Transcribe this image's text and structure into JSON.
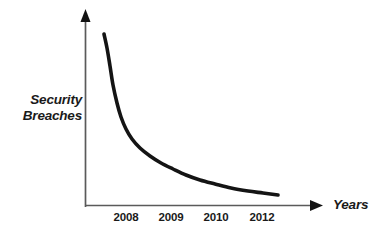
{
  "figure": {
    "background_color": "#ffffff",
    "curve_color": "#141414",
    "axis_color": "#5a5a5a",
    "text_color": "#1a1a1a"
  },
  "axes": {
    "y_title_line1": "Security",
    "y_title_line2": "Breaches",
    "x_title": "Years",
    "y_arrow": "arrow-up-icon",
    "x_arrow": "arrow-right-icon"
  },
  "caption": {
    "clipped_text": ""
  },
  "chart_data": {
    "type": "line",
    "title": "",
    "subtitle": "",
    "xlabel": "Years",
    "ylabel": "Security Breaches",
    "grid": false,
    "legend": null,
    "legend_position": "none",
    "annotations": [],
    "x_tick_labels": [
      "2008",
      "2009",
      "2010",
      "2012"
    ],
    "x_tick_positions": [
      126,
      171,
      216,
      262
    ],
    "y_tick_labels": [],
    "xlim": [
      85,
      322
    ],
    "ylim": [
      0,
      1
    ],
    "series": [
      {
        "name": "Security Breaches",
        "style": "smooth-decay-curve",
        "stroke_width": 3.6,
        "color": "#141414",
        "points": [
          [
            104,
            34
          ],
          [
            107,
            48
          ],
          [
            110,
            66
          ],
          [
            113,
            85
          ],
          [
            117,
            103
          ],
          [
            121,
            117
          ],
          [
            126,
            129
          ],
          [
            132,
            139
          ],
          [
            140,
            148
          ],
          [
            150,
            156
          ],
          [
            161,
            163
          ],
          [
            173,
            169
          ],
          [
            186,
            175
          ],
          [
            200,
            180
          ],
          [
            215,
            184
          ],
          [
            231,
            188
          ],
          [
            248,
            191
          ],
          [
            263,
            193
          ],
          [
            278,
            195
          ]
        ]
      }
    ]
  }
}
